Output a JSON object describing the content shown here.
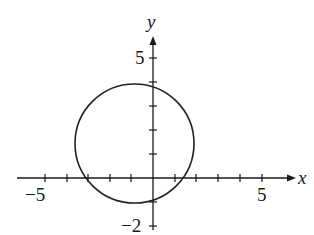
{
  "diagram": {
    "type": "coordinate-plane-circle",
    "axes": {
      "x_label": "x",
      "y_label": "y",
      "x_ticks": [
        -5,
        -4,
        -3,
        -2,
        -1,
        1,
        2,
        3,
        4,
        5
      ],
      "y_ticks": [
        -2,
        -1,
        1,
        2,
        3,
        4,
        5
      ],
      "x_tick_labels": {
        "neg": "−5",
        "pos": "5"
      },
      "y_tick_labels": {
        "pos": "5",
        "neg": "−2"
      }
    },
    "circle": {
      "center": [
        -1,
        1.5
      ],
      "radius": 2.5,
      "stroke": "#222222"
    },
    "colors": {
      "ink": "#1a1a1a",
      "background": "#ffffff"
    }
  }
}
